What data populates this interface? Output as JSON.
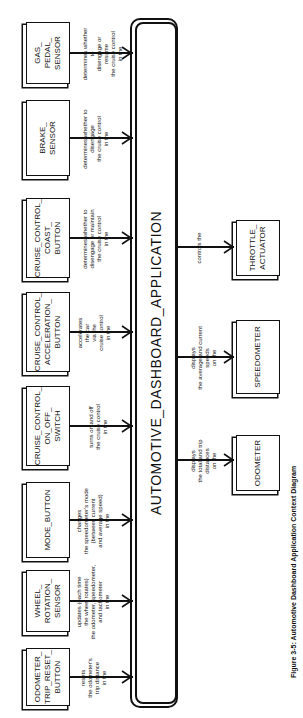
{
  "diagram": {
    "type": "context-diagram",
    "orientation": "rotated-90-ccw",
    "central_process": {
      "label": "AUTOMOTIVE_DASHBOARD_APPLICATION"
    },
    "inputs": [
      {
        "label": "ODOMETER_\nTRIP_RESET_\nBUTTON",
        "flow": "resets\nthe odometer's\ntrip distance\nin the"
      },
      {
        "label": "WHEEL_\nROTATION_\nSENSOR",
        "flow": "updates (each time\nthe wheel rotates)\nthe odometer, speedometer,\nand tachometer\nin the"
      },
      {
        "label": "MODE_BUTTON",
        "flow": "changes\nthe speedometer's mode\n(between current\nand average speed)\nin the"
      },
      {
        "label": "CRUISE_CONTROL_\nON_OFF_\nSWITCH",
        "flow": "turns on and off\nthe cruise control\nin the"
      },
      {
        "label": "CRUISE_CONTROL_\nACCELERATION_\nBUTTON",
        "flow": "accelerates\nthe car\nvia the\ncruise control\nin the"
      },
      {
        "label": "CRUISE_CONTROL_\nCOAST_\nBUTTON",
        "flow": "determines whether to\ndisengage or maintain\nthe cruise control\nin the"
      },
      {
        "label": "BRAKE_\nSENSOR",
        "flow": "determines whether to\ndisengage\nthe cruise control\nin the"
      },
      {
        "label": "GAS_\nPEDAL_\nSENSOR",
        "flow": "determines whether to\ndisengage or resume\nthe cruise control\nin the"
      }
    ],
    "outputs": [
      {
        "label": "ODOMETER",
        "flow": "displays\nthe total and trip\ndistances\non the"
      },
      {
        "label": "SPEEDOMETER",
        "flow": "displays\nthe average and current\nspeeds\non the"
      },
      {
        "label": "THROTTLE_\nACTUATOR",
        "flow": "controls the"
      }
    ],
    "caption": "Figure 3-5: Automotive Dashboard Application Context Diagram"
  }
}
